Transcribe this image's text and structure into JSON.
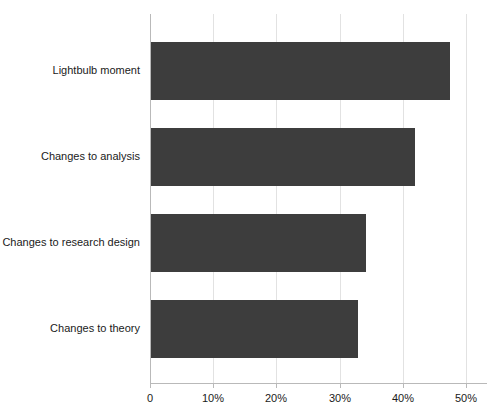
{
  "chart_data": {
    "type": "bar",
    "orientation": "horizontal",
    "title": "",
    "subtitle": "",
    "xlabel": "",
    "ylabel": "",
    "categories": [
      "Lightbulb moment",
      "Changes to analysis",
      "Changes to research design",
      "Changes to theory"
    ],
    "values": [
      47.5,
      41.9,
      34.2,
      32.9
    ],
    "series": [
      {
        "name": "",
        "values": [
          47.5,
          41.9,
          34.2,
          32.9
        ]
      }
    ],
    "xlim": [
      0,
      50
    ],
    "ylim": null,
    "xticks": [
      0,
      10,
      20,
      30,
      40,
      50
    ],
    "xtick_labels": [
      "0",
      "10%",
      "20%",
      "30%",
      "40%",
      "50%"
    ],
    "ytick_labels": [
      "Lightbulb moment",
      "Changes to analysis",
      "Changes to research design",
      "Changes to theory"
    ],
    "grid": "vertical",
    "legend": null,
    "legend_position": "none",
    "annotations": [],
    "colors": {
      "bar": "#3d3d3d",
      "gridline": "#e2e2e2",
      "axis": "#b9b9b9",
      "text": "#1a1a1a",
      "background": "#ffffff"
    }
  }
}
